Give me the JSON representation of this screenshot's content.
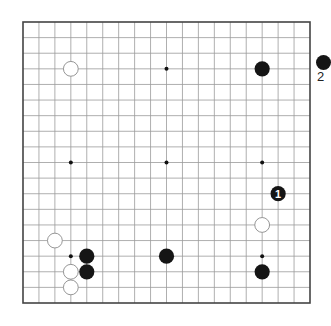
{
  "diagram": {
    "type": "go-board",
    "size": 19,
    "board_frame": {
      "x0": 23,
      "y0": 22,
      "x1": 310,
      "y1": 303
    },
    "colors": {
      "background": "#ffffff",
      "grid_line": "#9a9a9a",
      "border": "#444444",
      "black_stone": "#151515",
      "white_stone_fill": "#ffffff",
      "white_stone_edge": "#8a8a8a",
      "move_label": "#ffffff"
    },
    "star_points": [
      [
        4,
        4
      ],
      [
        10,
        4
      ],
      [
        16,
        4
      ],
      [
        4,
        10
      ],
      [
        10,
        10
      ],
      [
        16,
        10
      ],
      [
        4,
        16
      ],
      [
        10,
        16
      ],
      [
        16,
        16
      ]
    ],
    "stones": [
      {
        "color": "white",
        "col": 4,
        "row": 4,
        "label": ""
      },
      {
        "color": "black",
        "col": 16,
        "row": 4,
        "label": ""
      },
      {
        "color": "black",
        "col": 17,
        "row": 12,
        "label": "1"
      },
      {
        "color": "white",
        "col": 16,
        "row": 14,
        "label": ""
      },
      {
        "color": "black",
        "col": 16,
        "row": 17,
        "label": ""
      },
      {
        "color": "white",
        "col": 3,
        "row": 15,
        "label": ""
      },
      {
        "color": "black",
        "col": 5,
        "row": 16,
        "label": ""
      },
      {
        "color": "black",
        "col": 5,
        "row": 17,
        "label": ""
      },
      {
        "color": "white",
        "col": 4,
        "row": 17,
        "label": ""
      },
      {
        "color": "white",
        "col": 4,
        "row": 18,
        "label": ""
      },
      {
        "color": "black",
        "col": 10,
        "row": 16,
        "label": ""
      }
    ]
  },
  "side_caption": {
    "partial_stone": "black-stone-marker",
    "partial_text": "2"
  }
}
